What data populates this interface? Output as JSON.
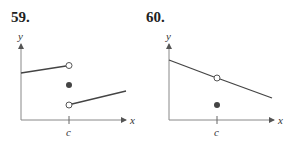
{
  "figures": [
    {
      "number": "59.",
      "y_label": "y",
      "x_label": "x",
      "tick_label": "c",
      "description": "Jump discontinuity at c: left segment ends at open circle, filled point between, right segment starts at lower open circle"
    },
    {
      "number": "60.",
      "y_label": "y",
      "x_label": "x",
      "tick_label": "c",
      "description": "Removable discontinuity at c: decreasing line with open circle at c, filled point below the line"
    }
  ],
  "colors": {
    "line": "#444444",
    "axis": "#777777",
    "dot": "#333333"
  }
}
